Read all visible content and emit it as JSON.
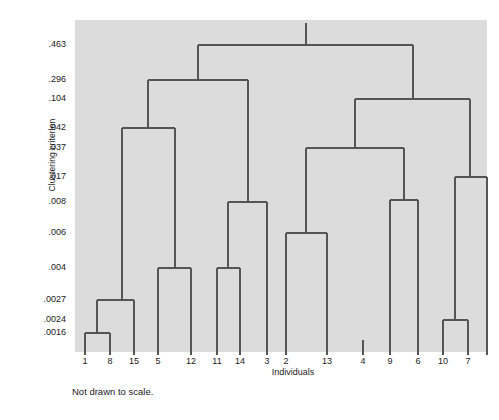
{
  "figure": {
    "background": "#ffffff",
    "plot_background": "#dcdcdc",
    "line_color": "#555555",
    "footnote": "Not drawn to scale."
  },
  "chart_data": {
    "type": "line",
    "subtype": "dendrogram",
    "title": "",
    "xlabel": "Individuals",
    "ylabel": "Clustering criterion",
    "grid": false,
    "legend": null,
    "orientation": "vertical",
    "note": "Not drawn to scale.",
    "axis_note": "y-axis ticks are unevenly spaced merge-height values",
    "leaf_order": [
      "1",
      "8",
      "15",
      "5",
      "12",
      "11",
      "14",
      "3",
      "2",
      "13",
      "4",
      "9",
      "6",
      "10",
      "7"
    ],
    "leaf_x_px": [
      85,
      110,
      134,
      158,
      191,
      217,
      240,
      267,
      286,
      327,
      363,
      390,
      418,
      443,
      468,
      487
    ],
    "y_tick_labels": [
      ".463",
      ".296",
      ".104",
      ".042",
      ".037",
      ".017",
      ".008",
      ".006",
      ".004",
      ".0027",
      ".0024",
      ".0016"
    ],
    "y_tick_values": [
      0.463,
      0.296,
      0.104,
      0.042,
      0.037,
      0.017,
      0.008,
      0.006,
      0.004,
      0.0027,
      0.0024,
      0.0016
    ],
    "y_tick_px": [
      45,
      80,
      99,
      128,
      148,
      177,
      202,
      233,
      268,
      300,
      320,
      333
    ],
    "x_tick_px": [
      85,
      110,
      134,
      158,
      191,
      217,
      240,
      267,
      286,
      327,
      363,
      390,
      418,
      443,
      468,
      487
    ],
    "merges": [
      {
        "id": "m1",
        "label": ".0016",
        "height": 0.0016,
        "left": "1",
        "right": "8",
        "y_px": 333,
        "x_left_px": 85,
        "x_right_px": 110,
        "stem_x_px": 97
      },
      {
        "id": "m2",
        "label": ".0024",
        "height": 0.0024,
        "left": "6",
        "right": "10",
        "y_px": 320,
        "x_left_px": 443,
        "x_right_px": 468,
        "stem_x_px": 455
      },
      {
        "id": "m3",
        "label": ".0027",
        "height": 0.0027,
        "left": "m1",
        "right": "15",
        "y_px": 300,
        "x_left_px": 97,
        "x_right_px": 134,
        "stem_x_px": 122
      },
      {
        "id": "m4",
        "label": ".004",
        "height": 0.004,
        "left": "5",
        "right": "12",
        "y_px": 268,
        "x_left_px": 158,
        "x_right_px": 191,
        "stem_x_px": 175
      },
      {
        "id": "m5",
        "label": ".004",
        "height": 0.004,
        "left": "11",
        "right": "14",
        "y_px": 268,
        "x_left_px": 217,
        "x_right_px": 240,
        "stem_x_px": 228
      },
      {
        "id": "m6",
        "label": ".006",
        "height": 0.006,
        "left": "2",
        "right": "13",
        "y_px": 233,
        "x_left_px": 286,
        "x_right_px": 327,
        "stem_x_px": 306
      },
      {
        "id": "m7",
        "label": ".008",
        "height": 0.008,
        "left": "m5",
        "right": "3",
        "y_px": 202,
        "x_left_px": 228,
        "x_right_px": 267,
        "stem_x_px": 248
      },
      {
        "id": "m8",
        "label": ".008",
        "height": 0.008,
        "left": "4",
        "right": "9",
        "y_px": 200,
        "x_left_px": 390,
        "x_right_px": 418,
        "stem_x_px": 404
      },
      {
        "id": "m9",
        "label": ".017",
        "height": 0.017,
        "left": "m2",
        "right": "7",
        "y_px": 177,
        "x_left_px": 455,
        "x_right_px": 487,
        "stem_x_px": 470
      },
      {
        "id": "m10",
        "label": ".037",
        "height": 0.037,
        "left": "m6",
        "right": "m8",
        "y_px": 148,
        "x_left_px": 306,
        "x_right_px": 404,
        "stem_x_px": 355
      },
      {
        "id": "m11",
        "label": ".042",
        "height": 0.042,
        "left": "m3",
        "right": "m4",
        "y_px": 128,
        "x_left_px": 122,
        "x_right_px": 175,
        "stem_x_px": 148
      },
      {
        "id": "m12",
        "label": ".104",
        "height": 0.104,
        "left": "m10",
        "right": "m9",
        "y_px": 99,
        "x_left_px": 355,
        "x_right_px": 470,
        "stem_x_px": 413
      },
      {
        "id": "m13",
        "label": ".296",
        "height": 0.296,
        "left": "m11",
        "right": "m7",
        "y_px": 80,
        "x_left_px": 148,
        "x_right_px": 248,
        "stem_x_px": 198
      },
      {
        "id": "m14",
        "label": ".463",
        "height": 0.463,
        "left": "m13",
        "right": "m12",
        "y_px": 45,
        "x_left_px": 198,
        "x_right_px": 413,
        "stem_x_px": 306
      }
    ]
  }
}
